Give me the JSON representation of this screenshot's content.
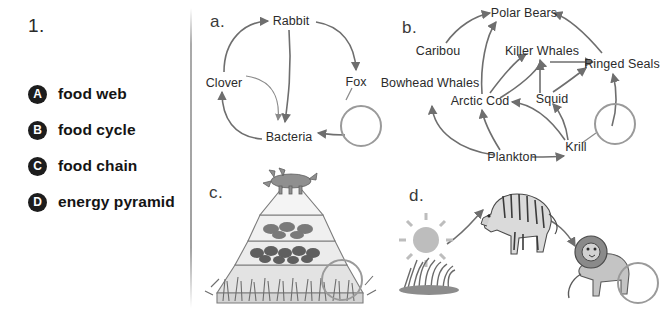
{
  "question": {
    "number": "1."
  },
  "options": [
    {
      "badge": "A",
      "label": "food web"
    },
    {
      "badge": "B",
      "label": "food cycle"
    },
    {
      "badge": "C",
      "label": "food chain"
    },
    {
      "badge": "D",
      "label": "energy pyramid"
    }
  ],
  "panels": {
    "a": {
      "letter": "a.",
      "nodes": [
        "Rabbit",
        "Clover",
        "Fox",
        "Bacteria"
      ]
    },
    "b": {
      "letter": "b.",
      "nodes": [
        "Polar Bears",
        "Caribou",
        "Killer Whales",
        "Ringed Seals",
        "Bowhead Whales",
        "Arctic Cod",
        "Squid",
        "Plankton",
        "Krill"
      ]
    },
    "c": {
      "letter": "c.",
      "art_items": [
        "wolf",
        "birds-tier",
        "insects-tier",
        "grass-tier"
      ]
    },
    "d": {
      "letter": "d.",
      "art_items": [
        "sun",
        "grass",
        "zebra",
        "lion"
      ]
    }
  },
  "colors": {
    "badge_fill": "#1d1d1d",
    "badge_text": "#ffffff",
    "arrow": "#6e6e6e",
    "answer_circle": "#9a9a9a",
    "text": "#2b2b2b",
    "divider": "#9b9b9b"
  }
}
